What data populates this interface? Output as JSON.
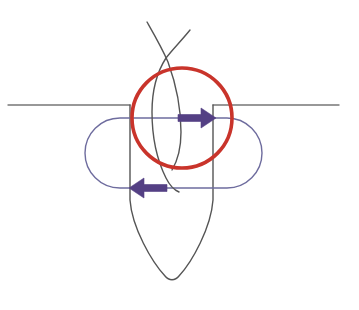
{
  "canvas": {
    "width": 359,
    "height": 310,
    "background_color": "#FFFFFF",
    "title": "Hand-drawn annotated cross-section sketch"
  },
  "palette": {
    "red_accent": "#C9342B",
    "purple_accent": "#544084",
    "stadium_outline": "#6E6C9E",
    "channel_dark": "#555555",
    "baseline_gray": "#777777",
    "background": "#FFFFFF"
  },
  "shapes": [
    {
      "id": "baseline-left",
      "name": "baseline-left-segment",
      "kind": "line",
      "color": "#777777",
      "stroke_width": 1.4,
      "x1": 8,
      "y1": 105,
      "x2": 130,
      "y2": 105
    },
    {
      "id": "baseline-right",
      "name": "baseline-right-segment",
      "kind": "line",
      "color": "#777777",
      "stroke_width": 1.4,
      "x1": 213,
      "y1": 105,
      "x2": 339,
      "y2": 105
    },
    {
      "id": "channel-outline",
      "name": "tapered-channel-outline",
      "kind": "path",
      "color": "#555555",
      "stroke_width": 1.4,
      "description": "U / V shaped tapered channel descending from the baseline to a rounded tip",
      "left_wall_x": 130,
      "right_wall_x": 213,
      "top_y": 105,
      "taper_start_y": 200,
      "tip_y": 281,
      "tip_x": 171
    },
    {
      "id": "stadium",
      "name": "stadium-outline",
      "kind": "rounded-rect",
      "color": "#6E6C9E",
      "stroke_width": 1.4,
      "x": 85,
      "y": 118,
      "width": 177,
      "height": 70,
      "corner_radius": 35
    },
    {
      "id": "red-circle",
      "name": "red-highlight-circle",
      "kind": "circle",
      "color": "#C9342B",
      "stroke_width": 3.6,
      "cx": 182,
      "cy": 118,
      "r": 50
    },
    {
      "id": "whisker-left",
      "name": "left-whisker-curve",
      "kind": "path",
      "color": "#555555",
      "stroke_width": 1.4,
      "description": "Slender curve entering from upper left, crossing its partner near the top"
    },
    {
      "id": "whisker-right",
      "name": "right-whisker-curve",
      "kind": "path",
      "color": "#555555",
      "stroke_width": 1.4,
      "description": "Slender curve entering from upper right, crossing its partner near the top"
    }
  ],
  "annotations": {
    "arrows": [
      {
        "id": "arrow-right",
        "name": "rightward-flow-arrow",
        "direction": "right",
        "color": "#544084",
        "tail_x": 178,
        "head_x": 216,
        "y": 118,
        "shaft_thickness": 7,
        "head_half_height": 10,
        "head_length": 15
      },
      {
        "id": "arrow-left",
        "name": "leftward-flow-arrow",
        "direction": "left",
        "color": "#544084",
        "tail_x": 167,
        "head_x": 129,
        "y": 188,
        "shaft_thickness": 7,
        "head_half_height": 10,
        "head_length": 15
      }
    ]
  },
  "crossing_point": {
    "x": 166,
    "y": 56
  }
}
